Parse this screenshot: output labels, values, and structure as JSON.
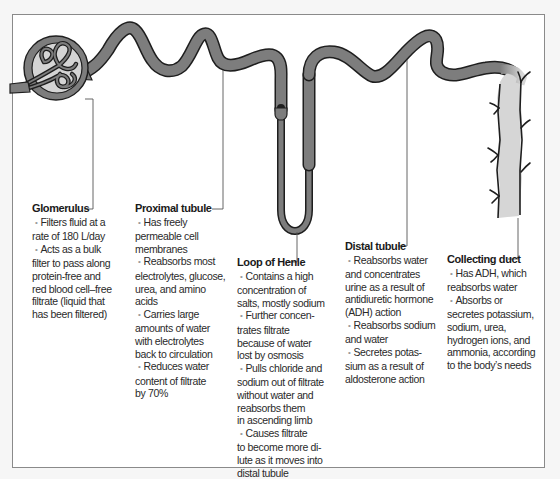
{
  "diagram": {
    "type": "nephron-anatomy",
    "colors": {
      "tubule_fill": "#7d7d7d",
      "tubule_outline": "#1e1e1e",
      "capsule_inner": "#d4d4d4",
      "collecting_duct_fill": "#d6d6d6",
      "leader_line": "#555555",
      "frame_border": "#8a8a8a",
      "text": "#2a2a2a"
    },
    "bullet_glyph": "•"
  },
  "labels": {
    "glomerulus": {
      "title": "Glomerulus",
      "lines": [
        "Filters fluid at a",
        "rate of 180 L/day",
        "Acts as a bulk",
        "filter to pass along",
        "protein-free and",
        "red blood cell–free",
        "filtrate (liquid that",
        "has been filtered)"
      ]
    },
    "proximal_tubule": {
      "title": "Proximal tubule",
      "lines": [
        "Has freely",
        "permeable cell",
        "membranes",
        "Reabsorbs most",
        "electrolytes, glucose,",
        "urea, and amino",
        "acids",
        "Carries large",
        "amounts of water",
        "with electrolytes",
        "back to circulation",
        "Reduces water",
        "content of filtrate",
        "by 70%"
      ]
    },
    "loop_of_henle": {
      "title": "Loop of Henle",
      "lines": [
        "Contains a high",
        "concentration of",
        "salts, mostly sodium",
        "Further concen-",
        "trates filtrate",
        "because of water",
        "lost by osmosis",
        "Pulls chloride and",
        "sodium out of filtrate",
        "without water and",
        "reabsorbs them",
        "in ascending limb",
        "Causes filtrate",
        "to become more di-",
        "lute as it moves into",
        "distal tubule"
      ]
    },
    "distal_tubule": {
      "title": "Distal tubule",
      "lines": [
        "Reabsorbs water",
        "and concentrates",
        "urine as a result of",
        "antidiuretic hormone",
        "(ADH) action",
        "Reabsorbs sodium",
        "and water",
        "Secretes potas-",
        "sium as a result of",
        "aldosterone action"
      ]
    },
    "collecting_duct": {
      "title": "Collecting duct",
      "lines": [
        "Has ADH, which",
        "reabsorbs water",
        "Absorbs or",
        "secretes potassium,",
        "sodium, urea,",
        "hydrogen ions, and",
        "ammonia, according",
        "to the body’s needs"
      ]
    }
  }
}
